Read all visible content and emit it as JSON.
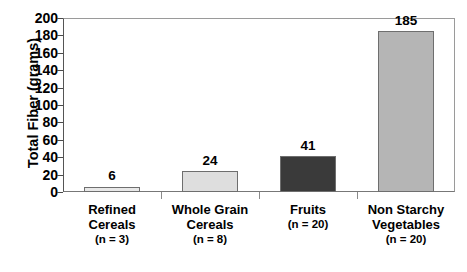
{
  "chart_data": {
    "type": "bar",
    "title": "",
    "subtitle": "",
    "xlabel": "",
    "ylabel": "Total Fiber (grams)",
    "categories": [
      "Refined Cereals",
      "Whole Grain Cereals",
      "Fruits",
      "Non Starchy Vegetables"
    ],
    "category_lines": [
      [
        "Refined",
        "Cereals"
      ],
      [
        "Whole Grain",
        "Cereals"
      ],
      [
        "Fruits"
      ],
      [
        "Non Starchy",
        "Vegetables"
      ]
    ],
    "category_counts": [
      "(n = 3)",
      "(n = 8)",
      "(n = 20)",
      "(n = 20)"
    ],
    "values": [
      6,
      24,
      41,
      185
    ],
    "data_labels": [
      "6",
      "24",
      "41",
      "185"
    ],
    "bar_colors": [
      "#e8e8e8",
      "#dedede",
      "#3a3a3a",
      "#b5b5b5"
    ],
    "bar_border_color": "#6e6e6e",
    "ylim": [
      0,
      200
    ],
    "ytick_step": 20,
    "ytick_labels": [
      "200",
      "180",
      "160",
      "140",
      "120",
      "100",
      "80",
      "60",
      "40",
      "20",
      "0"
    ],
    "ytick_values": [
      200,
      180,
      160,
      140,
      120,
      100,
      80,
      60,
      40,
      20,
      0
    ],
    "grid": false,
    "legend": false,
    "legend_position": "none",
    "axis_color": "#555555",
    "background_color": "#ffffff",
    "text_color": "#000000"
  }
}
